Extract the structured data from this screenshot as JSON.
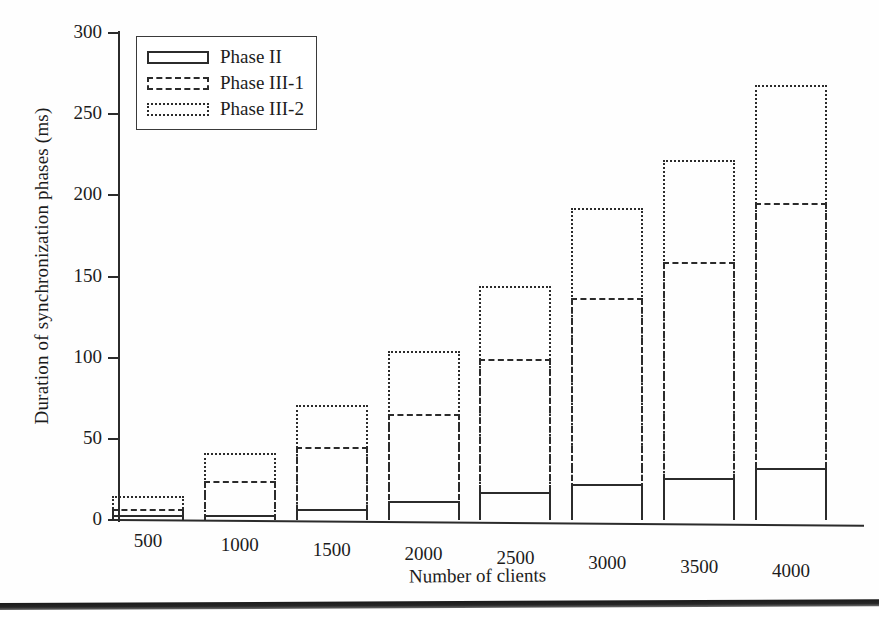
{
  "chart_data": {
    "type": "bar",
    "subtype": "stacked",
    "title": "",
    "xlabel": "Number of clients",
    "ylabel": "Duration of synchronization phases (ms)",
    "categories": [
      "500",
      "1000",
      "1500",
      "2000",
      "2500",
      "3000",
      "3500",
      "4000"
    ],
    "ylim": [
      0,
      300
    ],
    "yticks": [
      0,
      50,
      100,
      150,
      200,
      250,
      300
    ],
    "ytick_labels": [
      "0",
      "50",
      "100",
      "150",
      "200",
      "250",
      "300"
    ],
    "grid": false,
    "legend_position": "top-left",
    "series": [
      {
        "name": "Phase II",
        "style": "solid",
        "cumulative_top": [
          3,
          3,
          7,
          12,
          17,
          22,
          26,
          32
        ],
        "values": [
          3,
          3,
          7,
          12,
          17,
          22,
          26,
          32
        ]
      },
      {
        "name": "Phase III-1",
        "style": "dashed",
        "cumulative_top": [
          7,
          24,
          45,
          65,
          99,
          137,
          159,
          195
        ],
        "values": [
          4,
          21,
          38,
          53,
          82,
          115,
          133,
          163
        ]
      },
      {
        "name": "Phase III-2",
        "style": "dotted",
        "cumulative_top": [
          15,
          41,
          71,
          104,
          144,
          192,
          222,
          268
        ],
        "values": [
          8,
          17,
          26,
          39,
          45,
          55,
          63,
          73
        ]
      }
    ]
  },
  "legend": {
    "items": [
      {
        "label": "Phase II",
        "style": "solid"
      },
      {
        "label": "Phase III-1",
        "style": "dashed"
      },
      {
        "label": "Phase III-2",
        "style": "dotted"
      }
    ]
  },
  "colors": {
    "ink": "#2b2b2b",
    "text": "#1c1c1c",
    "background": "#fefefe"
  }
}
